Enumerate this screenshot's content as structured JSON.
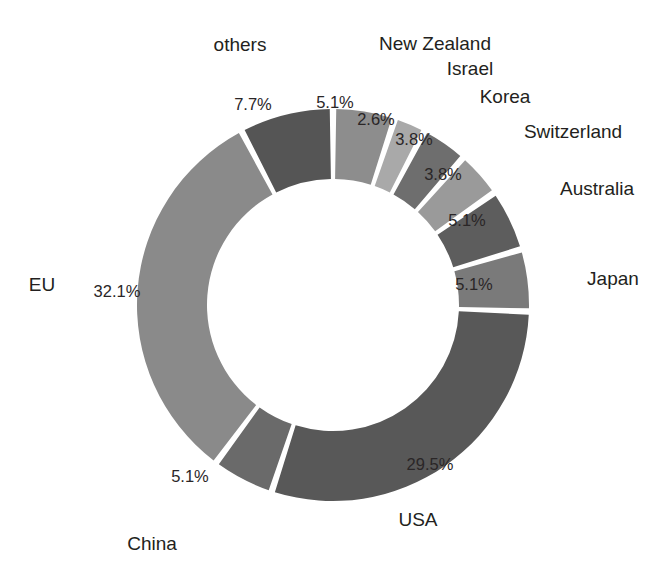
{
  "chart_data": {
    "type": "pie",
    "variant": "donut",
    "title": "",
    "subtitle": "",
    "xlabel": "",
    "ylabel": "",
    "legend_position": "outer-labels",
    "grid": false,
    "value_unit": "%",
    "start_angle_deg": 0,
    "direction": "clockwise",
    "categories": [
      "New Zealand",
      "Israel",
      "Korea",
      "Switzerland",
      "Australia",
      "Japan",
      "USA",
      "China",
      "EU",
      "others"
    ],
    "values": [
      5.1,
      2.6,
      3.8,
      3.8,
      5.1,
      5.1,
      29.5,
      5.1,
      32.1,
      7.7
    ],
    "value_labels": [
      "5.1%",
      "2.6%",
      "3.8%",
      "3.8%",
      "5.1%",
      "5.1%",
      "29.5%",
      "5.1%",
      "32.1%",
      "7.7%"
    ],
    "colors": [
      "#8d8d8d",
      "#a9a9a9",
      "#6e6e6e",
      "#9a9a9a",
      "#5d5d5d",
      "#7a7a7a",
      "#585858",
      "#6a6a6a",
      "#8a8a8a",
      "#555555"
    ],
    "slices": [
      {
        "name": "New Zealand",
        "value": 5.1,
        "label": "New Zealand",
        "value_label": "5.1%",
        "color": "#8d8d8d",
        "label_x": 435,
        "label_y": 44,
        "label_align": "align-center",
        "pct_x": 335,
        "pct_y": 104
      },
      {
        "name": "Israel",
        "value": 2.6,
        "label": "Israel",
        "value_label": "2.6%",
        "color": "#a9a9a9",
        "label_x": 470,
        "label_y": 69,
        "label_align": "align-center",
        "pct_x": 376,
        "pct_y": 121
      },
      {
        "name": "Korea",
        "value": 3.8,
        "label": "Korea",
        "value_label": "3.8%",
        "color": "#6e6e6e",
        "label_x": 505,
        "label_y": 97,
        "label_align": "align-center",
        "pct_x": 414,
        "pct_y": 141
      },
      {
        "name": "Switzerland",
        "value": 3.8,
        "label": "Switzerland",
        "value_label": "3.8%",
        "color": "#9a9a9a",
        "label_x": 573,
        "label_y": 132,
        "label_align": "align-center",
        "pct_x": 443,
        "pct_y": 176
      },
      {
        "name": "Australia",
        "value": 5.1,
        "label": "Australia",
        "value_label": "5.1%",
        "color": "#5d5d5d",
        "label_x": 597,
        "label_y": 189,
        "label_align": "align-center",
        "pct_x": 467,
        "pct_y": 222
      },
      {
        "name": "Japan",
        "value": 5.1,
        "label": "Japan",
        "value_label": "5.1%",
        "color": "#7a7a7a",
        "label_x": 613,
        "label_y": 279,
        "label_align": "align-center",
        "pct_x": 474,
        "pct_y": 286
      },
      {
        "name": "USA",
        "value": 29.5,
        "label": "USA",
        "value_label": "29.5%",
        "color": "#585858",
        "label_x": 418,
        "label_y": 520,
        "label_align": "align-center",
        "pct_x": 430,
        "pct_y": 466
      },
      {
        "name": "China",
        "value": 5.1,
        "label": "China",
        "value_label": "5.1%",
        "color": "#6a6a6a",
        "label_x": 152,
        "label_y": 544,
        "label_align": "align-center",
        "pct_x": 190,
        "pct_y": 478
      },
      {
        "name": "EU",
        "value": 32.1,
        "label": "EU",
        "value_label": "32.1%",
        "color": "#8a8a8a",
        "label_x": 42,
        "label_y": 285,
        "label_align": "align-center",
        "pct_x": 117,
        "pct_y": 293
      },
      {
        "name": "others",
        "value": 7.7,
        "label": "others",
        "value_label": "7.7%",
        "color": "#555555",
        "label_x": 240,
        "label_y": 45,
        "label_align": "align-center",
        "pct_x": 253,
        "pct_y": 106
      }
    ]
  },
  "figure": {
    "background": "#ffffff",
    "slice_gap_color": "#ffffff",
    "label_color": "#231f20"
  }
}
